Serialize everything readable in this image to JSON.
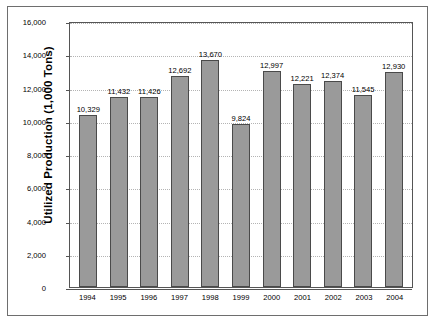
{
  "chart_data": {
    "type": "bar",
    "title": "",
    "subtitle": "",
    "xlabel": "",
    "ylabel": "Utilized Production (1,000 Tons)",
    "categories": [
      "1994",
      "1995",
      "1996",
      "1997",
      "1998",
      "1999",
      "2000",
      "2001",
      "2002",
      "2003",
      "2004"
    ],
    "values": [
      10329,
      11432,
      11426,
      12692,
      13670,
      9824,
      12997,
      12221,
      12374,
      11545,
      12930
    ],
    "value_labels": [
      "10,329",
      "11,432",
      "11,426",
      "12,692",
      "13,670",
      "9,824",
      "12,997",
      "12,221",
      "12,374",
      "11,545",
      "12,930"
    ],
    "ylim": [
      0,
      16000
    ],
    "ytick_values": [
      0,
      2000,
      4000,
      6000,
      8000,
      10000,
      12000,
      14000,
      16000
    ],
    "ytick_labels": [
      "0",
      "2,000",
      "4,000",
      "6,000",
      "8,000",
      "10,000",
      "12,000",
      "14,000",
      "16,000"
    ],
    "grid": true,
    "grid_axis": "y",
    "grid_style": "dotted",
    "legend": null,
    "legend_position": "none",
    "colors": {
      "bar_fill": "#9a9a9a",
      "bar_border": "#4a4a4a",
      "gridline": "#b4b4b4",
      "axis_line": "#555555",
      "frame": "#6e6e6e",
      "text": "#000000",
      "background": "#ffffff"
    }
  }
}
